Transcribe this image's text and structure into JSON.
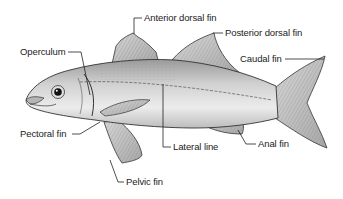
{
  "diagram": {
    "labels": {
      "anterior_dorsal_fin": "Anterior dorsal fin",
      "posterior_dorsal_fin": "Posterior dorsal fin",
      "operculum": "Operculum",
      "caudal_fin": "Caudal fin",
      "pectoral_fin": "Pectoral fin",
      "lateral_line": "Lateral line",
      "anal_fin": "Anal fin",
      "pelvic_fin": "Pelvic fin"
    },
    "colors": {
      "body": "#c9c9c9",
      "body_highlight": "#ececec",
      "outline": "#333333",
      "leader_line": "#222222",
      "text": "#222222"
    }
  }
}
